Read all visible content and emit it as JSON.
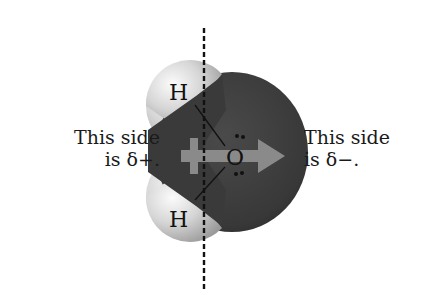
{
  "diagram": {
    "molecule": "water",
    "atoms": {
      "oxygen": {
        "symbol": "O",
        "color": "#3d3d3d"
      },
      "hydrogen_top": {
        "symbol": "H",
        "color": "#d8d8d8"
      },
      "hydrogen_bottom": {
        "symbol": "H",
        "color": "#d8d8d8"
      }
    },
    "labels": {
      "left_line1": "This side",
      "left_line2": "is δ+.",
      "right_line1": "This side",
      "right_line2": "is δ−."
    },
    "dipole_arrow": {
      "direction": "right",
      "color": "#8a8a8a",
      "icon": "dipole-arrow-icon"
    },
    "symmetry_line": {
      "style": "dashed",
      "orientation": "vertical"
    },
    "lone_pairs": 2
  }
}
